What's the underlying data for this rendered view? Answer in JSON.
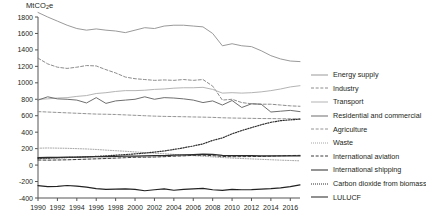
{
  "chart_data": {
    "type": "line",
    "title": "",
    "ylabel": "MtCO2e",
    "ylabel_display": "MtCO",
    "ylabel_sub": "2",
    "ylabel_tail": "e",
    "xlabel": "",
    "xlim": [
      1990,
      2017
    ],
    "ylim": [
      -400,
      1800
    ],
    "grid": false,
    "legend_position": "right",
    "x": [
      1990,
      1991,
      1992,
      1993,
      1994,
      1995,
      1996,
      1997,
      1998,
      1999,
      2000,
      2001,
      2002,
      2003,
      2004,
      2005,
      2006,
      2007,
      2008,
      2009,
      2010,
      2011,
      2012,
      2013,
      2014,
      2015,
      2016,
      2017
    ],
    "ytick_labels": [
      "1800",
      "1600",
      "1400",
      "1200",
      "1000",
      "800",
      "600",
      "400",
      "200",
      "0",
      "-200",
      "-400"
    ],
    "ytick_values": [
      1800,
      1600,
      1400,
      1200,
      1000,
      800,
      600,
      400,
      200,
      0,
      -200,
      -400
    ],
    "xtick_labels": [
      "1990",
      "1992",
      "1994",
      "1996",
      "1998",
      "2000",
      "2002",
      "2004",
      "2006",
      "2008",
      "2010",
      "2012",
      "2014",
      "2016"
    ],
    "xtick_values": [
      1990,
      1992,
      1994,
      1996,
      1998,
      2000,
      2002,
      2004,
      2006,
      2008,
      2010,
      2012,
      2014,
      2016
    ],
    "series": [
      {
        "name": "Energy supply",
        "style": "solid",
        "color": "#9a9a9a",
        "width": 1.0,
        "values": [
          1855,
          1800,
          1750,
          1700,
          1660,
          1640,
          1655,
          1640,
          1630,
          1610,
          1640,
          1670,
          1660,
          1690,
          1700,
          1700,
          1690,
          1680,
          1600,
          1450,
          1475,
          1450,
          1440,
          1390,
          1330,
          1290,
          1265,
          1258
        ]
      },
      {
        "name": "Industry",
        "style": "dashed",
        "color": "#8c8c8c",
        "width": 1.0,
        "values": [
          1300,
          1230,
          1190,
          1175,
          1190,
          1210,
          1205,
          1160,
          1120,
          1070,
          1050,
          1040,
          1030,
          1035,
          1030,
          1040,
          1030,
          1040,
          960,
          790,
          800,
          760,
          745,
          740,
          740,
          730,
          720,
          715
        ]
      },
      {
        "name": "Transport",
        "style": "solid",
        "color": "#b4b4b4",
        "width": 1.0,
        "values": [
          800,
          805,
          815,
          820,
          835,
          845,
          870,
          880,
          895,
          905,
          905,
          910,
          920,
          925,
          935,
          940,
          940,
          945,
          920,
          875,
          880,
          875,
          880,
          890,
          905,
          925,
          950,
          965
        ]
      },
      {
        "name": "Residential and commercial",
        "style": "solid",
        "color": "#6f6f6f",
        "width": 1.0,
        "values": [
          790,
          830,
          805,
          800,
          790,
          755,
          820,
          750,
          780,
          790,
          800,
          830,
          800,
          820,
          815,
          805,
          790,
          760,
          780,
          730,
          785,
          700,
          745,
          740,
          645,
          655,
          665,
          650
        ]
      },
      {
        "name": "Agriculture",
        "style": "dashed",
        "color": "#949494",
        "width": 1.0,
        "values": [
          650,
          645,
          640,
          635,
          630,
          625,
          620,
          618,
          615,
          610,
          605,
          600,
          595,
          592,
          590,
          588,
          585,
          583,
          580,
          575,
          572,
          570,
          568,
          566,
          565,
          564,
          563,
          562
        ]
      },
      {
        "name": "Waste",
        "style": "dotted",
        "color": "#a5a5a5",
        "width": 1.0,
        "values": [
          205,
          208,
          206,
          204,
          200,
          196,
          190,
          182,
          175,
          168,
          160,
          152,
          145,
          138,
          130,
          122,
          115,
          108,
          100,
          92,
          85,
          80,
          75,
          70,
          65,
          60,
          56,
          52
        ]
      },
      {
        "name": "International aviation",
        "style": "dashed",
        "color": "#3d3d3d",
        "width": 1.0,
        "values": [
          62,
          60,
          62,
          64,
          68,
          72,
          76,
          80,
          85,
          90,
          95,
          96,
          98,
          102,
          108,
          112,
          118,
          120,
          115,
          105,
          102,
          103,
          104,
          105,
          108,
          112,
          116,
          118
        ]
      },
      {
        "name": "International shipping",
        "style": "solid",
        "color": "#2b2b2b",
        "width": 1.3,
        "values": [
          90,
          92,
          94,
          96,
          98,
          100,
          102,
          104,
          106,
          108,
          110,
          112,
          114,
          116,
          120,
          124,
          128,
          132,
          130,
          118,
          116,
          115,
          114,
          113,
          112,
          112,
          112,
          112
        ]
      },
      {
        "name": "Carbon dioxide from biomass",
        "style": "dotted",
        "color": "#2f2f2f",
        "width": 1.2,
        "values": [
          82,
          85,
          88,
          92,
          96,
          100,
          106,
          112,
          120,
          128,
          136,
          146,
          158,
          172,
          190,
          210,
          232,
          258,
          300,
          330,
          380,
          420,
          455,
          490,
          520,
          540,
          550,
          558
        ]
      },
      {
        "name": "LULUCF",
        "style": "solid",
        "color": "#222222",
        "width": 1.2,
        "values": [
          -250,
          -262,
          -258,
          -248,
          -256,
          -268,
          -286,
          -296,
          -292,
          -290,
          -296,
          -312,
          -300,
          -290,
          -306,
          -296,
          -290,
          -284,
          -300,
          -308,
          -296,
          -300,
          -298,
          -292,
          -286,
          -276,
          -262,
          -240
        ]
      }
    ]
  },
  "legend": {
    "items": [
      {
        "label": "Energy supply"
      },
      {
        "label": "Industry"
      },
      {
        "label": "Transport"
      },
      {
        "label": "Residential and commercial"
      },
      {
        "label": "Agriculture"
      },
      {
        "label": "Waste"
      },
      {
        "label": "International aviation"
      },
      {
        "label": "International shipping"
      },
      {
        "label": "Carbon dioxide from biomass"
      },
      {
        "label": "LULUCF"
      }
    ]
  }
}
